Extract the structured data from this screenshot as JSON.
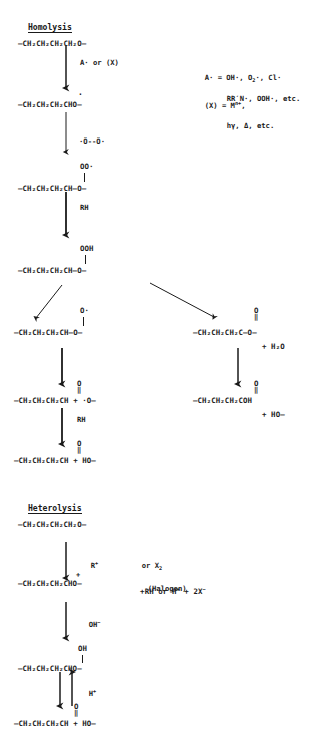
{
  "document": {
    "type": "reaction-scheme",
    "title": "Polyether degradation mechanisms",
    "background_color": "#ffffff",
    "ink_color": "#1a1a1a"
  },
  "sections": [
    {
      "id": "homolysis",
      "heading": "Homolysis"
    },
    {
      "id": "heterolysis",
      "heading": "Heterolysis"
    }
  ],
  "legend": {
    "radical_line1": "A· = OH·, O",
    "radical_line1_sub": "2",
    "radical_line1_tail": "·, Cl·",
    "radical_line2": "RR′N·, OOH·, etc.",
    "catalyst_line1_prefix": "(X) = M",
    "catalyst_line1_sup": "n+",
    "catalyst_line1_tail": ",",
    "catalyst_line2": "hγ, Δ, etc."
  },
  "homolysis": {
    "s1": {
      "name": "polyether-chain",
      "text": "—CH₂CH₂CH₂CH₂O—"
    },
    "r1": {
      "name": "initiation-reagent",
      "text": "A· or (X)"
    },
    "s2": {
      "name": "carbon-radical",
      "text": "—CH₂CH₂CH₂CHO—",
      "superscript": "·"
    },
    "r2": {
      "name": "oxygen-diradical",
      "text": "·Ö--Ö·"
    },
    "s3": {
      "name": "peroxy-radical",
      "text": "—CH₂CH₂CH₂CH—O—",
      "branch": "OO·"
    },
    "r3": {
      "name": "hydrogen-donor-rh",
      "text": "RH"
    },
    "s4": {
      "name": "hydroperoxide",
      "text": "—CH₂CH₂CH₂CH—O—",
      "branch": "OOH"
    },
    "s5": {
      "name": "alkoxy-radical",
      "text": "—CH₂CH₂CH₂CH—O—",
      "branch": "O·"
    },
    "s6": {
      "name": "aldehyde-plus-alkoxy",
      "text": "—CH₂CH₂CH₂CH + ·O—",
      "branch_atom": "O",
      "branch_bond": "‖"
    },
    "r4": {
      "name": "hydrogen-donor-rh-2",
      "text": "RH"
    },
    "s7": {
      "name": "aldehyde-plus-ho",
      "text": "—CH₂CH₂CH₂CH + HO—",
      "branch_atom": "O",
      "branch_bond": "‖"
    },
    "s8": {
      "name": "ester-and-water",
      "text": "—CH₂CH₂CH₂C—O—",
      "branch_atom": "O",
      "branch_bond": "‖",
      "side": "+ H₂O"
    },
    "s9": {
      "name": "carboxylic-acid",
      "text": "—CH₂CH₂CH₂COH",
      "branch_atom": "O",
      "branch_bond": "‖",
      "side": "+ HO—"
    }
  },
  "heterolysis": {
    "s1": {
      "name": "polyether-chain-2",
      "text": "—CH₂CH₂CH₂CH₂O—"
    },
    "r1": {
      "name": "cation-reagent",
      "text": "R",
      "sup": "+"
    },
    "r1b": {
      "name": "halogen-reagent",
      "line1": "or X",
      "line1_sub": "2",
      "line2": "(Halogen)"
    },
    "s2": {
      "name": "carbocation",
      "text": "—CH₂CH₂CH₂CHO—",
      "superscript": "+"
    },
    "s2side": {
      "name": "byproducts",
      "text": "+RH or H",
      "sup1": "+",
      "mid": " + 2X",
      "sup2": "−"
    },
    "r2": {
      "name": "hydroxide-reagent",
      "text": "OH",
      "sup": "−"
    },
    "s3": {
      "name": "hemiacetal",
      "text": "—CH₂CH₂CH₂CHO—",
      "branch": "OH"
    },
    "r3": {
      "name": "proton-equilibrium",
      "text": "H",
      "sup": "+"
    },
    "s4": {
      "name": "aldehyde-plus-ho-2",
      "text": "—CH₂CH₂CH₂CH + HO—",
      "branch_atom": "O",
      "branch_bond": "‖"
    }
  }
}
